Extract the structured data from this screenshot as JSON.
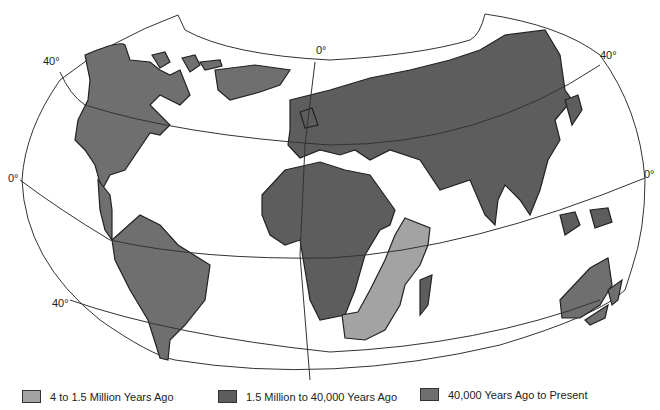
{
  "map": {
    "labels": {
      "lat40_left": "40°",
      "lat0_left": "0°",
      "latm40_left": "40°",
      "meridian0_top": "0°",
      "lat40_right": "40°",
      "lat0_right": "0°"
    },
    "colors": {
      "early": "#a3a3a3",
      "middle": "#5d5d5d",
      "recent": "#6f6f6f",
      "ocean": "#ffffff",
      "grid": "#333333"
    }
  },
  "legend": {
    "items": [
      {
        "label": "4 to 1.5 Million Years Ago",
        "color": "#a3a3a3"
      },
      {
        "label": "1.5 Million to 40,000 Years Ago",
        "color": "#5d5d5d"
      },
      {
        "label": "40,000 Years Ago to Present",
        "color": "#6f6f6f"
      }
    ]
  }
}
